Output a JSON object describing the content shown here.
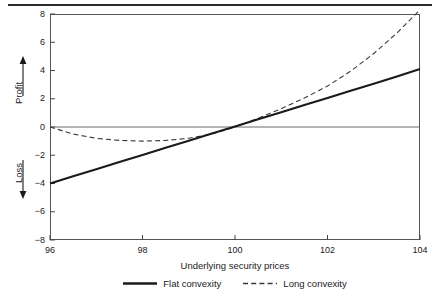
{
  "chart_data": {
    "type": "line",
    "title": "",
    "subtitle": "",
    "xlabel": "Underlying security prices",
    "ylabel_positive": "Profit",
    "ylabel_negative": "Loss",
    "xlim": [
      96,
      104
    ],
    "ylim": [
      -8,
      8
    ],
    "xticks": [
      96,
      98,
      100,
      102,
      104
    ],
    "yticks": [
      8,
      6,
      4,
      2,
      0,
      -2,
      -4,
      -6,
      -8
    ],
    "xtick_labels": [
      "96",
      "98",
      "100",
      "102",
      "104"
    ],
    "ytick_labels": [
      "8",
      "6",
      "4",
      "2",
      "0",
      "−2",
      "−4",
      "−6",
      "−8"
    ],
    "grid": false,
    "zero_line": true,
    "legend_position": "bottom-center",
    "x": [
      96,
      96.5,
      97,
      97.5,
      98,
      98.5,
      99,
      99.5,
      100,
      100.5,
      101,
      101.5,
      102,
      102.5,
      103,
      103.5,
      104
    ],
    "series": [
      {
        "name": "Flat convexity",
        "style": "solid",
        "color": "#1a1a1a",
        "values": [
          -4.0,
          -3.49,
          -2.99,
          -2.48,
          -1.98,
          -1.47,
          -0.97,
          -0.46,
          0.04,
          0.55,
          1.05,
          1.56,
          2.06,
          2.57,
          3.07,
          3.58,
          4.1
        ]
      },
      {
        "name": "Long convexity",
        "style": "dashed",
        "color": "#3a3a3a",
        "values": [
          0.0,
          -0.5,
          -0.8,
          -0.95,
          -1.0,
          -0.95,
          -0.8,
          -0.5,
          0.0,
          0.62,
          1.3,
          2.05,
          2.9,
          3.95,
          5.2,
          6.65,
          8.3
        ]
      }
    ],
    "annotations": [],
    "axis_arrows": {
      "profit_arrow": "up-arrow",
      "loss_arrow": "down-arrow"
    }
  },
  "legend": {
    "entries": [
      {
        "label": "Flat convexity",
        "style": "solid"
      },
      {
        "label": "Long convexity",
        "style": "dashed"
      }
    ]
  },
  "axes": {
    "x_title": "Underlying security prices",
    "y_positive_title": "Profit",
    "y_negative_title": "Loss"
  }
}
